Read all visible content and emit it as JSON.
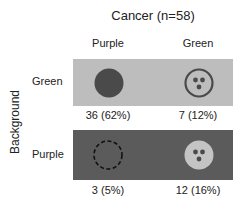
{
  "title": "Cancer (n=58)",
  "y_axis_label": "Background",
  "columns": [
    {
      "label": "Purple"
    },
    {
      "label": "Green"
    }
  ],
  "rows": [
    {
      "label": "Green",
      "cells": [
        {
          "symbol": "filled-dark-circle",
          "count": "36 (62%)"
        },
        {
          "symbol": "ring-with-three-dots",
          "count": "7 (12%)"
        }
      ]
    },
    {
      "label": "Purple",
      "cells": [
        {
          "symbol": "dashed-circle",
          "count": "3 (5%)"
        },
        {
          "symbol": "light-circle-with-three-dots",
          "count": "12 (16%)"
        }
      ]
    }
  ],
  "colors": {
    "green_background_box": "#bdbdbd",
    "purple_background_box": "#5b5b5b",
    "dark_symbol": "#4a4a4a",
    "light_symbol": "#c4c4c4"
  }
}
